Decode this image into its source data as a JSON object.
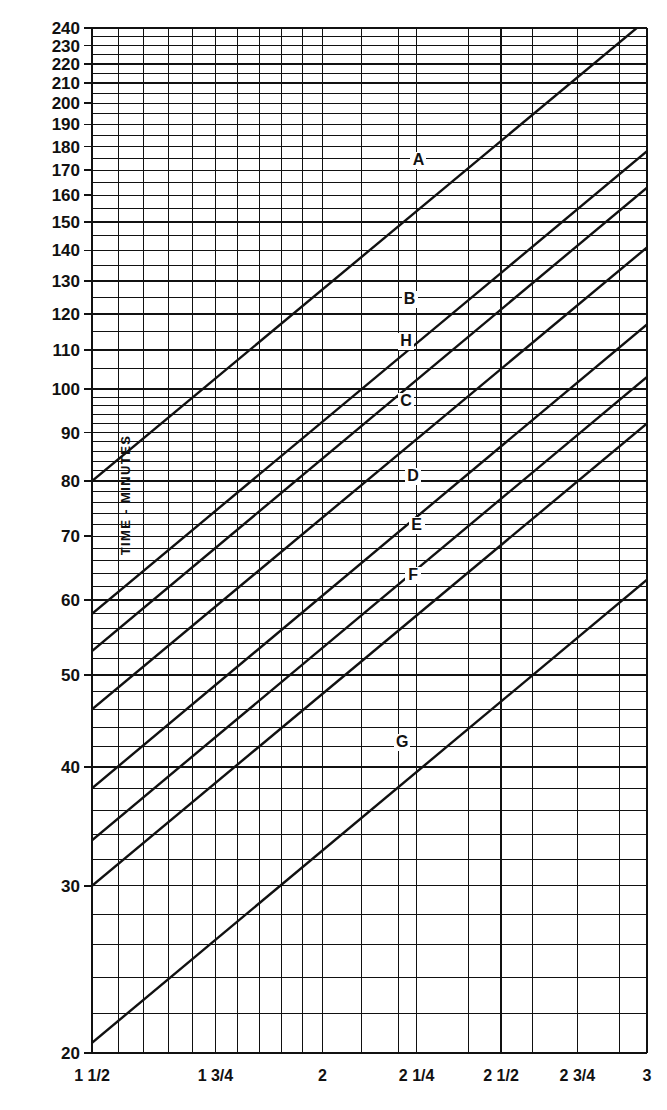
{
  "figure": {
    "background": "#ffffff",
    "ink": "#111111",
    "ylabel": "TIME - MINUTES"
  },
  "chart_data": {
    "type": "line",
    "title": "",
    "subtitle": "",
    "xlabel": "",
    "ylabel": "TIME - MINUTES",
    "xscale": "log",
    "yscale": "log",
    "grid": true,
    "legend_position": "inline-labels",
    "xlim": [
      1.5,
      3.0
    ],
    "ylim": [
      20,
      240
    ],
    "x_tick_labels": [
      "1 1/2",
      "1 3/4",
      "2",
      "2 1/4",
      "2 1/2",
      "2 3/4",
      "3"
    ],
    "x_tick_values": [
      1.5,
      1.75,
      2.0,
      2.25,
      2.5,
      2.75,
      3.0
    ],
    "x_minor_values": [
      1.55,
      1.6,
      1.65,
      1.7,
      1.8,
      1.85,
      1.9,
      1.95,
      2.1,
      2.2,
      2.4,
      2.6,
      2.8,
      2.9
    ],
    "x_gridlines": [
      1.5,
      1.55,
      1.6,
      1.65,
      1.7,
      1.75,
      1.8,
      1.85,
      1.9,
      1.95,
      2.0,
      2.1,
      2.2,
      2.25,
      2.4,
      2.5,
      2.6,
      2.75,
      2.9,
      3.0
    ],
    "y_tick_labels": [
      "240",
      "230",
      "220",
      "210",
      "200",
      "190",
      "180",
      "170",
      "160",
      "150",
      "140",
      "130",
      "120",
      "110",
      "100",
      "90",
      "80",
      "70",
      "60",
      "50",
      "40",
      "30",
      "20"
    ],
    "y_tick_values": [
      240,
      230,
      220,
      210,
      200,
      190,
      180,
      170,
      160,
      150,
      140,
      130,
      120,
      110,
      100,
      90,
      80,
      70,
      60,
      50,
      40,
      30,
      20
    ],
    "y_minor_values": [
      22,
      24,
      26,
      28,
      32,
      34,
      36,
      38,
      42,
      44,
      46,
      48,
      52,
      54,
      56,
      58,
      62,
      64,
      66,
      68,
      72,
      74,
      76,
      78,
      82,
      84,
      86,
      88,
      92,
      94,
      96,
      98,
      105,
      115,
      125,
      135,
      145,
      155,
      165,
      175,
      185,
      195,
      205,
      215,
      225,
      235
    ],
    "series": [
      {
        "name": "A",
        "label": "A",
        "label_x": 2.255,
        "label_y": 172,
        "x_start": 1.5,
        "y_start": 80.0,
        "x_end": 3.0,
        "y_end": 245.0
      },
      {
        "name": "B",
        "label": "B",
        "label_x": 2.23,
        "label_y": 123,
        "x_start": 1.5,
        "y_start": 58.0,
        "x_end": 3.0,
        "y_end": 178.0
      },
      {
        "name": "H",
        "label": "H",
        "label_x": 2.22,
        "label_y": 111,
        "x_start": 1.5,
        "y_start": 53.0,
        "x_end": 3.0,
        "y_end": 163.0
      },
      {
        "name": "C",
        "label": "C",
        "label_x": 2.22,
        "label_y": 96,
        "x_start": 1.5,
        "y_start": 46.0,
        "x_end": 3.0,
        "y_end": 141.0
      },
      {
        "name": "D",
        "label": "D",
        "label_x": 2.24,
        "label_y": 80,
        "x_start": 1.5,
        "y_start": 38.0,
        "x_end": 3.0,
        "y_end": 117.0
      },
      {
        "name": "E",
        "label": "E",
        "label_x": 2.25,
        "label_y": 71,
        "x_start": 1.5,
        "y_start": 33.5,
        "x_end": 3.0,
        "y_end": 103.0
      },
      {
        "name": "F",
        "label": "F",
        "label_x": 2.24,
        "label_y": 63,
        "x_start": 1.5,
        "y_start": 30.0,
        "x_end": 3.0,
        "y_end": 92.0
      },
      {
        "name": "G",
        "label": "G",
        "label_x": 2.21,
        "label_y": 42,
        "x_start": 1.5,
        "y_start": 20.5,
        "x_end": 3.0,
        "y_end": 63.0
      }
    ]
  }
}
